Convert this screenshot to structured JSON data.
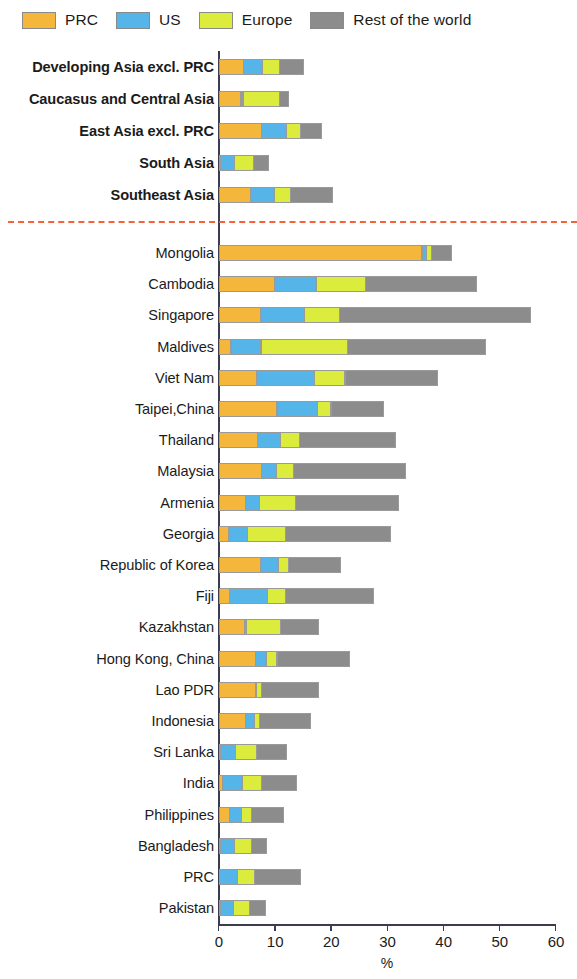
{
  "legend": {
    "items": [
      {
        "label": "PRC",
        "color": "#f5b63c",
        "icon": "legend-swatch-prc"
      },
      {
        "label": "US",
        "color": "#55b4e8",
        "icon": "legend-swatch-us"
      },
      {
        "label": "Europe",
        "color": "#dcec3c",
        "icon": "legend-swatch-europe"
      },
      {
        "label": "Rest of the world",
        "color": "#8c8c8c",
        "icon": "legend-swatch-row"
      }
    ]
  },
  "axis": {
    "x_title": "%",
    "ticks": [
      "0",
      "10",
      "20",
      "30",
      "40",
      "50",
      "60"
    ]
  },
  "divider": {
    "color": "#f4623a"
  },
  "chart_data": {
    "type": "bar",
    "subtype": "horizontal-stacked",
    "title": "",
    "xlabel": "%",
    "ylabel": "",
    "xlim": [
      0,
      60
    ],
    "grid": false,
    "legend_position": "top-left",
    "stacked": true,
    "series": [
      {
        "name": "PRC",
        "color": "#f5b63c"
      },
      {
        "name": "US",
        "color": "#55b4e8"
      },
      {
        "name": "Europe",
        "color": "#dcec3c"
      },
      {
        "name": "Rest of the world",
        "color": "#8c8c8c"
      }
    ],
    "groups": [
      {
        "name": "aggregates",
        "categories": [
          "Developing Asia excl. PRC",
          "Caucasus and Central Asia",
          "East Asia excl. PRC",
          "South Asia",
          "Southeast Asia"
        ],
        "values": [
          [
            4.4,
            3.6,
            3.1,
            4.4
          ],
          [
            4.0,
            0.5,
            6.6,
            1.8
          ],
          [
            7.7,
            4.6,
            2.6,
            3.9
          ],
          [
            0.2,
            2.6,
            3.6,
            2.8
          ],
          [
            5.7,
            4.3,
            3.1,
            7.7
          ]
        ],
        "totals": [
          15.5,
          12.9,
          18.8,
          9.2,
          20.8
        ]
      },
      {
        "name": "economies",
        "categories": [
          "Mongolia",
          "Cambodia",
          "Singapore",
          "Maldives",
          "Viet Nam",
          "Taipei,China",
          "Thailand",
          "Malaysia",
          "Armenia",
          "Georgia",
          "Republic of Korea",
          "Fiji",
          "Kazakhstan",
          "Hong Kong, China",
          "Lao PDR",
          "Indonesia",
          "Sri Lanka",
          "India",
          "Philippines",
          "Bangladesh",
          "PRC",
          "Pakistan"
        ],
        "values": [
          [
            36.2,
            0.9,
            1.1,
            3.8
          ],
          [
            9.9,
            7.6,
            8.9,
            19.9
          ],
          [
            7.4,
            8.0,
            6.4,
            34.2
          ],
          [
            2.2,
            5.5,
            15.6,
            24.7
          ],
          [
            6.8,
            10.4,
            5.6,
            16.6
          ],
          [
            10.4,
            7.3,
            2.6,
            9.5
          ],
          [
            6.9,
            4.2,
            3.6,
            17.2
          ],
          [
            7.6,
            2.8,
            3.2,
            20.2
          ],
          [
            4.8,
            2.6,
            6.6,
            18.4
          ],
          [
            1.7,
            3.6,
            6.9,
            18.8
          ],
          [
            7.4,
            3.4,
            2.0,
            9.3
          ],
          [
            2.0,
            6.9,
            3.3,
            15.8
          ],
          [
            4.6,
            0.5,
            6.2,
            7.0
          ],
          [
            6.6,
            2.0,
            2.1,
            13.0
          ],
          [
            6.6,
            0.2,
            0.9,
            10.3
          ],
          [
            4.8,
            1.8,
            0.9,
            9.3
          ],
          [
            0.3,
            2.8,
            3.9,
            5.5
          ],
          [
            0.7,
            3.6,
            3.6,
            6.5
          ],
          [
            2.0,
            2.2,
            2.0,
            5.8
          ],
          [
            0.4,
            2.6,
            3.2,
            2.8
          ],
          [
            0.0,
            3.4,
            3.1,
            8.4
          ],
          [
            0.3,
            2.4,
            3.0,
            3.1
          ]
        ],
        "totals": [
          42.0,
          46.3,
          56.0,
          48.0,
          39.4,
          29.8,
          31.9,
          33.8,
          32.4,
          31.0,
          22.1,
          28.0,
          18.3,
          23.7,
          18.0,
          16.8,
          12.5,
          14.4,
          12.0,
          9.0,
          14.9,
          8.8
        ]
      }
    ]
  }
}
